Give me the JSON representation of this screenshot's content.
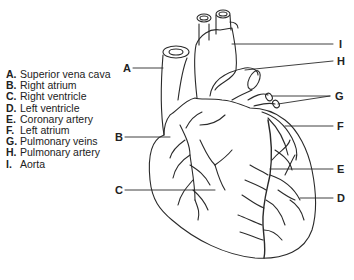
{
  "legend": {
    "items": [
      {
        "key": "A.",
        "label": "Superior vena cava"
      },
      {
        "key": "B.",
        "label": "Right atrium"
      },
      {
        "key": "C.",
        "label": "Right ventricle"
      },
      {
        "key": "D.",
        "label": "Left ventricle"
      },
      {
        "key": "E.",
        "label": "Coronary artery"
      },
      {
        "key": "F.",
        "label": "Left atrium"
      },
      {
        "key": "G.",
        "label": "Pulmonary veins"
      },
      {
        "key": "H.",
        "label": "Pulmonary artery"
      },
      {
        "key": "I.",
        "label": "Aorta"
      }
    ]
  },
  "callouts": {
    "A": "A",
    "B": "B",
    "C": "C",
    "D": "D",
    "E": "E",
    "F": "F",
    "G": "G",
    "H": "H",
    "I": "I"
  },
  "colors": {
    "line": "#2a2a2a",
    "text": "#222222",
    "background": "#ffffff"
  }
}
